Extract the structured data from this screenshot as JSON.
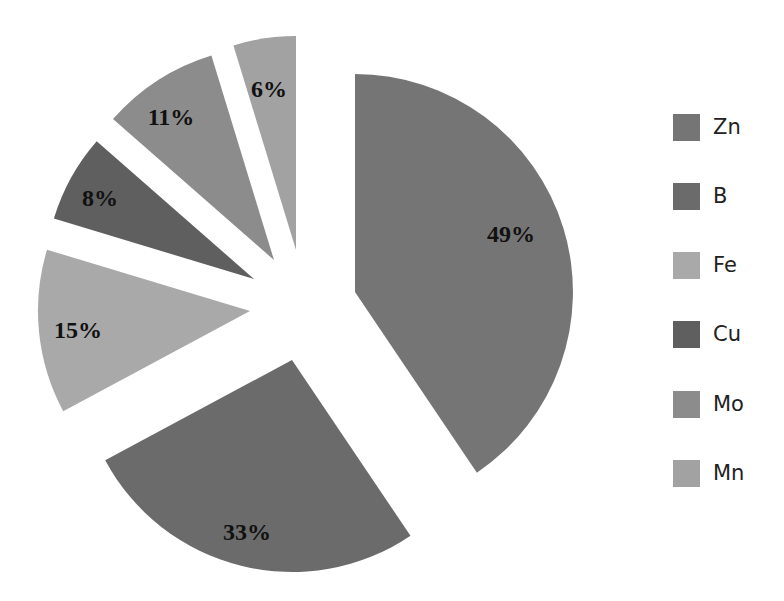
{
  "chart_data": {
    "type": "pie",
    "title": "",
    "exploded": true,
    "legend_position": "right",
    "categories": [
      "Zn",
      "B",
      "Fe",
      "Cu",
      "Mo",
      "Mn"
    ],
    "values": [
      49,
      33,
      15,
      8,
      11,
      6
    ],
    "labels": [
      "49%",
      "33%",
      "15%",
      "8%",
      "11%",
      "6%"
    ],
    "colors": [
      "#757575",
      "#6b6b6b",
      "#a9a9a9",
      "#5f5f5f",
      "#8c8c8c",
      "#a2a2a2"
    ]
  },
  "geometry": {
    "slices": [
      {
        "apex": [
          355,
          292
        ],
        "r": 218,
        "start": 0,
        "end": 146,
        "label_pos": [
          511,
          242
        ]
      },
      {
        "apex": [
          292,
          360
        ],
        "r": 212,
        "start": 146,
        "end": 241.8,
        "label_pos": [
          247,
          540
        ]
      },
      {
        "apex": [
          250,
          311
        ],
        "r": 212,
        "start": 241.8,
        "end": 286.8,
        "label_pos": [
          78,
          338
        ]
      },
      {
        "apex": [
          254,
          279
        ],
        "r": 209,
        "start": 286.8,
        "end": 311.2,
        "label_pos": [
          100,
          206
        ]
      },
      {
        "apex": [
          274,
          260
        ],
        "r": 214,
        "start": 311.2,
        "end": 343,
        "label_pos": [
          171,
          125
        ]
      },
      {
        "apex": [
          296,
          250
        ],
        "r": 214,
        "start": 343,
        "end": 360,
        "label_pos": [
          269,
          97
        ]
      }
    ]
  },
  "legend": {
    "items": [
      {
        "label": "Zn",
        "color": "#757575"
      },
      {
        "label": "B",
        "color": "#6b6b6b"
      },
      {
        "label": "Fe",
        "color": "#a9a9a9"
      },
      {
        "label": "Cu",
        "color": "#5f5f5f"
      },
      {
        "label": "Mo",
        "color": "#8c8c8c"
      },
      {
        "label": "Mn",
        "color": "#a2a2a2"
      }
    ]
  }
}
